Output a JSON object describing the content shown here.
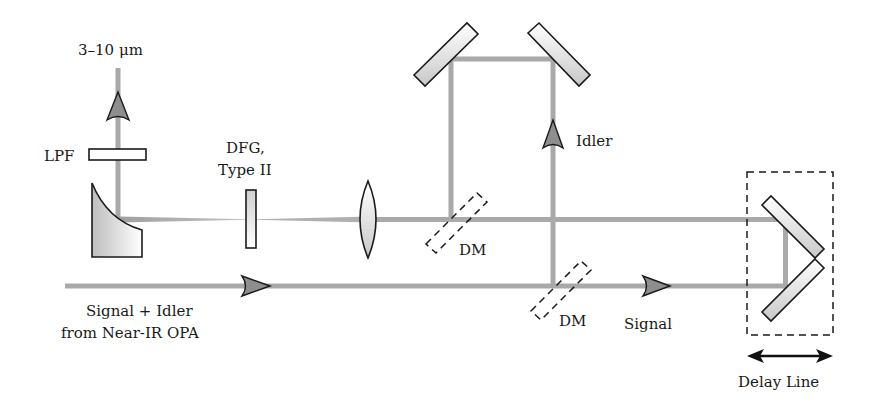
{
  "diagram": {
    "colors": {
      "beam": "#a9a9a9",
      "outline": "#1a1a1a",
      "arrow_fill": "#8e8e8e",
      "background": "#ffffff"
    },
    "labels": {
      "output_wavelength": "3–10 μm",
      "lpf": "LPF",
      "dfg_line1": "DFG,",
      "dfg_line2": "Type II",
      "idler": "Idler",
      "dm_upper": "DM",
      "dm_lower": "DM",
      "signal": "Signal",
      "input_line1": "Signal + Idler",
      "input_line2": "from Near-IR OPA",
      "delay_line": "Delay Line"
    },
    "components": [
      {
        "name": "parabolic-mirror",
        "label": ""
      },
      {
        "name": "long-pass-filter",
        "label": "LPF"
      },
      {
        "name": "dfg-crystal",
        "label": "DFG, Type II"
      },
      {
        "name": "focusing-lens",
        "label": ""
      },
      {
        "name": "dichroic-mirror-upper",
        "label": "DM"
      },
      {
        "name": "dichroic-mirror-lower",
        "label": "DM"
      },
      {
        "name": "fold-mirror-left",
        "label": ""
      },
      {
        "name": "fold-mirror-right",
        "label": ""
      },
      {
        "name": "delay-line-retroreflector",
        "label": "Delay Line"
      }
    ],
    "beams": [
      {
        "name": "input-beam",
        "label": "Signal + Idler from Near-IR OPA",
        "direction": "right"
      },
      {
        "name": "idler-beam",
        "label": "Idler",
        "direction": "up"
      },
      {
        "name": "signal-beam",
        "label": "Signal",
        "direction": "right"
      },
      {
        "name": "output-beam",
        "label": "3–10 μm",
        "direction": "up"
      }
    ]
  }
}
